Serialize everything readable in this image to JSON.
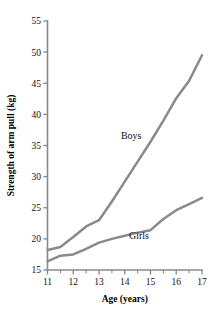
{
  "chart_data": {
    "type": "line",
    "title": "",
    "subtitle": "",
    "xlabel": "Age (years)",
    "ylabel": "Strength of arm pull (kg)",
    "xlim": [
      11,
      17
    ],
    "ylim": [
      15,
      55
    ],
    "grid": false,
    "legend_position": "inline-annotations",
    "line_color": "#8a8a8a",
    "axis_color": "#888888",
    "text_color": "#111111",
    "background": "#ffffff",
    "x_ticks": [
      11,
      12,
      13,
      14,
      15,
      16,
      17
    ],
    "x_tick_labels": [
      "11",
      "12",
      "13",
      "14",
      "15",
      "16",
      "17"
    ],
    "x_minor_ticks": [
      11.5,
      12.5,
      13.5,
      14.5,
      15.5,
      16.5
    ],
    "y_ticks": [
      15,
      20,
      25,
      30,
      35,
      40,
      45,
      50,
      55
    ],
    "y_tick_labels": [
      "15",
      "20",
      "25",
      "30",
      "35",
      "40",
      "45",
      "50",
      "55"
    ],
    "series": [
      {
        "name": "Boys",
        "label": "Boys",
        "label_x": 14.25,
        "label_y": 36.0,
        "x": [
          11.0,
          11.5,
          12.0,
          12.5,
          13.0,
          13.5,
          14.0,
          14.5,
          15.0,
          15.5,
          16.0,
          16.5,
          17.0
        ],
        "values": [
          18.2,
          18.7,
          20.3,
          22.0,
          23.0,
          26.0,
          29.2,
          32.4,
          35.6,
          39.0,
          42.6,
          45.4,
          49.5
        ]
      },
      {
        "name": "Girls",
        "label": "Girls",
        "label_x": 14.55,
        "label_y": 19.9,
        "x": [
          11.0,
          11.5,
          12.0,
          12.5,
          13.0,
          13.5,
          14.0,
          14.5,
          15.0,
          15.5,
          16.0,
          16.5,
          17.0
        ],
        "values": [
          16.4,
          17.3,
          17.5,
          18.4,
          19.4,
          20.0,
          20.5,
          21.0,
          21.4,
          23.2,
          24.6,
          25.6,
          26.6
        ]
      }
    ]
  }
}
